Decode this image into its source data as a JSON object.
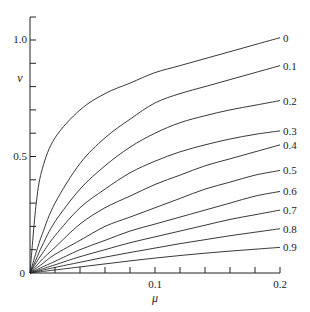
{
  "chart_data": {
    "type": "line",
    "title": "",
    "xlabel": "μ",
    "ylabel": "ν",
    "xlim": [
      0,
      0.2
    ],
    "ylim": [
      0,
      1.1
    ],
    "grid": false,
    "legend_position": "inline-right",
    "x_ticks": [
      0.02,
      0.04,
      0.06,
      0.08,
      0.1,
      0.12,
      0.14,
      0.16,
      0.18,
      0.2
    ],
    "x_tick_labels": [
      {
        "value": 0.1,
        "label": "0.1"
      },
      {
        "value": 0.2,
        "label": "0.2"
      }
    ],
    "y_ticks": [
      0.1,
      0.2,
      0.3,
      0.4,
      0.5,
      0.6,
      0.7,
      0.8,
      0.9,
      1.0,
      1.1
    ],
    "y_tick_labels": [
      {
        "value": 0.5,
        "label": "0.5"
      },
      {
        "value": 1.0,
        "label": "1.0"
      }
    ],
    "origin_label": "0",
    "x": [
      0,
      0.005,
      0.01,
      0.02,
      0.04,
      0.06,
      0.08,
      0.1,
      0.12,
      0.14,
      0.16,
      0.18,
      0.2
    ],
    "series": [
      {
        "name": "0",
        "values": [
          0,
          0.3,
          0.45,
          0.58,
          0.7,
          0.77,
          0.815,
          0.86,
          0.89,
          0.92,
          0.95,
          0.98,
          1.01
        ]
      },
      {
        "name": "0.1",
        "values": [
          0,
          0.09,
          0.17,
          0.3,
          0.47,
          0.58,
          0.66,
          0.73,
          0.77,
          0.8,
          0.83,
          0.86,
          0.89
        ]
      },
      {
        "name": "0.2",
        "values": [
          0,
          0.06,
          0.12,
          0.22,
          0.36,
          0.46,
          0.54,
          0.6,
          0.645,
          0.675,
          0.7,
          0.72,
          0.74
        ]
      },
      {
        "name": "0.3",
        "values": [
          0,
          0.045,
          0.085,
          0.16,
          0.28,
          0.36,
          0.43,
          0.48,
          0.52,
          0.55,
          0.575,
          0.595,
          0.61
        ]
      },
      {
        "name": "0.4",
        "values": [
          0,
          0.03,
          0.06,
          0.11,
          0.21,
          0.28,
          0.33,
          0.38,
          0.42,
          0.46,
          0.49,
          0.52,
          0.55
        ]
      },
      {
        "name": "0.5",
        "values": [
          0,
          0.02,
          0.04,
          0.08,
          0.14,
          0.2,
          0.24,
          0.28,
          0.32,
          0.36,
          0.39,
          0.42,
          0.44
        ]
      },
      {
        "name": "0.6",
        "values": [
          0,
          0.013,
          0.026,
          0.05,
          0.1,
          0.14,
          0.18,
          0.21,
          0.24,
          0.27,
          0.3,
          0.33,
          0.35
        ]
      },
      {
        "name": "0.7",
        "values": [
          0,
          0.009,
          0.018,
          0.035,
          0.07,
          0.1,
          0.13,
          0.155,
          0.18,
          0.205,
          0.23,
          0.25,
          0.27
        ]
      },
      {
        "name": "0.8",
        "values": [
          0,
          0.006,
          0.012,
          0.024,
          0.046,
          0.068,
          0.088,
          0.107,
          0.126,
          0.143,
          0.16,
          0.175,
          0.19
        ]
      },
      {
        "name": "0.9",
        "values": [
          0,
          0.0033,
          0.0066,
          0.013,
          0.026,
          0.039,
          0.052,
          0.064,
          0.075,
          0.085,
          0.094,
          0.102,
          0.11
        ]
      }
    ]
  }
}
